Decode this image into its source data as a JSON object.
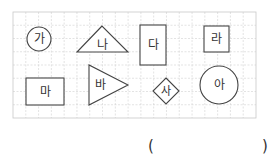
{
  "figure": {
    "grid": {
      "x": 13,
      "y": 12,
      "width": 243,
      "height": 106,
      "cols": 19,
      "rows": 8,
      "line_color": "#d0d0d0",
      "border_color": "#c8c8c8"
    },
    "stroke_color": "#444444",
    "shapes": [
      {
        "id": "ga",
        "label": "가",
        "type": "circle",
        "cx": 39,
        "cy": 39,
        "r": 12
      },
      {
        "id": "na",
        "label": "나",
        "type": "triangle",
        "points": "102,26 77,52 128,52",
        "tx": 102,
        "ty": 45
      },
      {
        "id": "da",
        "label": "다",
        "type": "rect",
        "x": 140,
        "y": 25,
        "w": 26,
        "h": 40
      },
      {
        "id": "ra",
        "label": "라",
        "type": "rect",
        "x": 204,
        "y": 26,
        "w": 25,
        "h": 26
      },
      {
        "id": "ma",
        "label": "마",
        "type": "rect",
        "x": 26,
        "y": 78,
        "w": 38,
        "h": 27
      },
      {
        "id": "ba",
        "label": "바",
        "type": "triangle",
        "points": "89,65 89,105 128,85",
        "tx": 100,
        "ty": 85
      },
      {
        "id": "sa",
        "label": "사",
        "type": "diamond",
        "cx": 166,
        "cy": 91,
        "s": 13
      },
      {
        "id": "a",
        "label": "아",
        "type": "circle",
        "cx": 219,
        "cy": 85,
        "r": 19
      }
    ]
  },
  "answer": {
    "open": "(",
    "close": ")"
  }
}
